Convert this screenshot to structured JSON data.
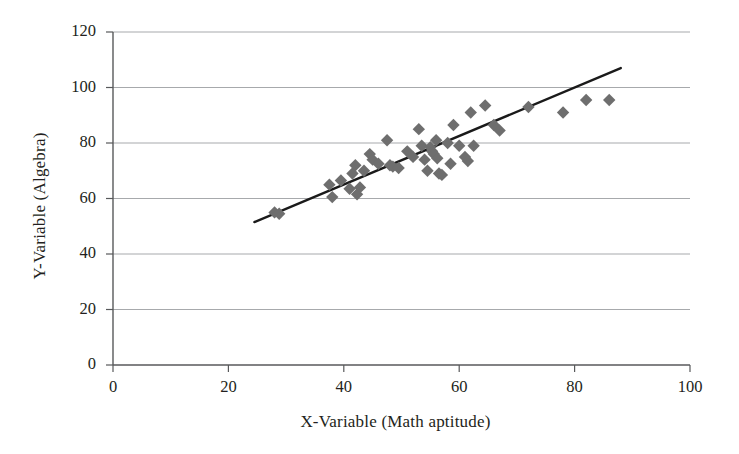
{
  "chart_data": {
    "type": "scatter",
    "title": "",
    "xlabel": "X-Variable (Math aptitude)",
    "ylabel": "Y-Variable (Algebra)",
    "xlim": [
      0,
      100
    ],
    "ylim": [
      0,
      120
    ],
    "xticks": [
      0,
      20,
      40,
      60,
      80,
      100
    ],
    "yticks": [
      0,
      20,
      40,
      60,
      80,
      100,
      120
    ],
    "grid": "horizontal",
    "legend": "none",
    "marker": "diamond",
    "marker_color": "#6e6e6e",
    "trendline": {
      "visible": true,
      "color": "#1a1a1a",
      "x_start": 24.5,
      "y_start": 51.5,
      "x_end": 88.0,
      "y_end": 107.0
    },
    "series": [
      {
        "name": "Students",
        "points": [
          [
            28.0,
            55.0
          ],
          [
            28.8,
            54.5
          ],
          [
            37.5,
            65.0
          ],
          [
            38.0,
            60.5
          ],
          [
            39.5,
            66.5
          ],
          [
            41.0,
            63.5
          ],
          [
            41.5,
            69.0
          ],
          [
            42.0,
            72.0
          ],
          [
            42.3,
            61.5
          ],
          [
            42.8,
            64.0
          ],
          [
            43.5,
            70.0
          ],
          [
            44.5,
            76.0
          ],
          [
            45.0,
            74.0
          ],
          [
            46.0,
            72.5
          ],
          [
            47.5,
            81.0
          ],
          [
            48.0,
            72.0
          ],
          [
            48.5,
            71.5
          ],
          [
            49.5,
            71.0
          ],
          [
            51.0,
            77.0
          ],
          [
            52.0,
            75.0
          ],
          [
            53.0,
            85.0
          ],
          [
            53.5,
            79.0
          ],
          [
            54.0,
            74.0
          ],
          [
            54.5,
            70.0
          ],
          [
            55.0,
            78.5
          ],
          [
            55.3,
            77.0
          ],
          [
            55.6,
            76.0
          ],
          [
            56.0,
            81.0
          ],
          [
            56.2,
            74.5
          ],
          [
            56.5,
            69.0
          ],
          [
            57.0,
            68.5
          ],
          [
            58.0,
            80.0
          ],
          [
            58.5,
            72.5
          ],
          [
            59.0,
            86.5
          ],
          [
            60.0,
            79.0
          ],
          [
            61.0,
            75.0
          ],
          [
            61.5,
            73.5
          ],
          [
            62.0,
            91.0
          ],
          [
            62.5,
            79.0
          ],
          [
            64.5,
            93.5
          ],
          [
            66.0,
            86.5
          ],
          [
            67.0,
            84.5
          ],
          [
            72.0,
            93.0
          ],
          [
            78.0,
            91.0
          ],
          [
            82.0,
            95.5
          ],
          [
            86.0,
            95.5
          ]
        ]
      }
    ]
  }
}
